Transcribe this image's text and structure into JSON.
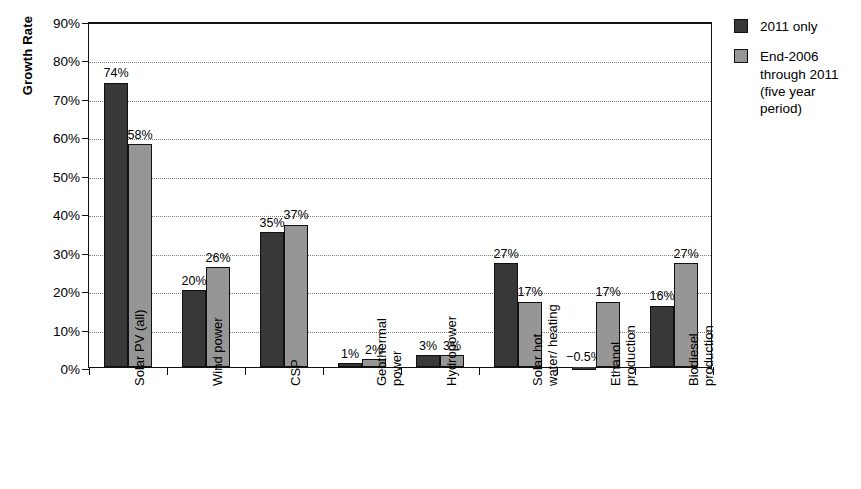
{
  "chart_data": {
    "type": "bar",
    "title": "",
    "xlabel": "",
    "ylabel": "Growth Rate",
    "ylim": [
      0,
      90
    ],
    "ytick_labels": [
      "0%",
      "10%",
      "20%",
      "30%",
      "40%",
      "50%",
      "60%",
      "70%",
      "80%",
      "90%"
    ],
    "ytick_values": [
      0,
      10,
      20,
      30,
      40,
      50,
      60,
      70,
      80,
      90
    ],
    "grid": true,
    "legend_position": "right",
    "categories": [
      "Solar PV (all)",
      "Wind power",
      "CSP",
      "Geothermal power",
      "Hydropower",
      "Solar hot water/ heating",
      "Ethanol production",
      "Biodiesel production"
    ],
    "category_lines": [
      [
        "Solar PV (all)"
      ],
      [
        "Wind power"
      ],
      [
        "CSP"
      ],
      [
        "Geothermal",
        "power"
      ],
      [
        "Hydropower"
      ],
      [
        "Solar hot",
        "water/ heating"
      ],
      [
        "Ethanol",
        "production"
      ],
      [
        "Biodiesel",
        "production"
      ]
    ],
    "series": [
      {
        "name": "2011 only",
        "color": "#383838",
        "values": [
          74,
          20,
          35,
          1,
          3,
          27,
          -0.5,
          16
        ],
        "labels": [
          "74%",
          "20%",
          "35%",
          "1%",
          "3%",
          "27%",
          "−0.5%",
          "16%"
        ]
      },
      {
        "name": "End-2006 through 2011 (five year period)",
        "color": "#969696",
        "values": [
          58,
          26,
          37,
          2,
          3,
          17,
          17,
          27
        ],
        "labels": [
          "58%",
          "26%",
          "37%",
          "2%",
          "3%",
          "17%",
          "17%",
          "27%"
        ]
      }
    ]
  },
  "legend": {
    "items": [
      {
        "label": "2011 only",
        "color": "#383838"
      },
      {
        "label": "End-2006 through 2011 (five year period)",
        "color": "#969696"
      }
    ],
    "item_lines": [
      [
        "2011 only"
      ],
      [
        "End-2006",
        "through 2011",
        "(five year",
        "period)"
      ]
    ]
  }
}
